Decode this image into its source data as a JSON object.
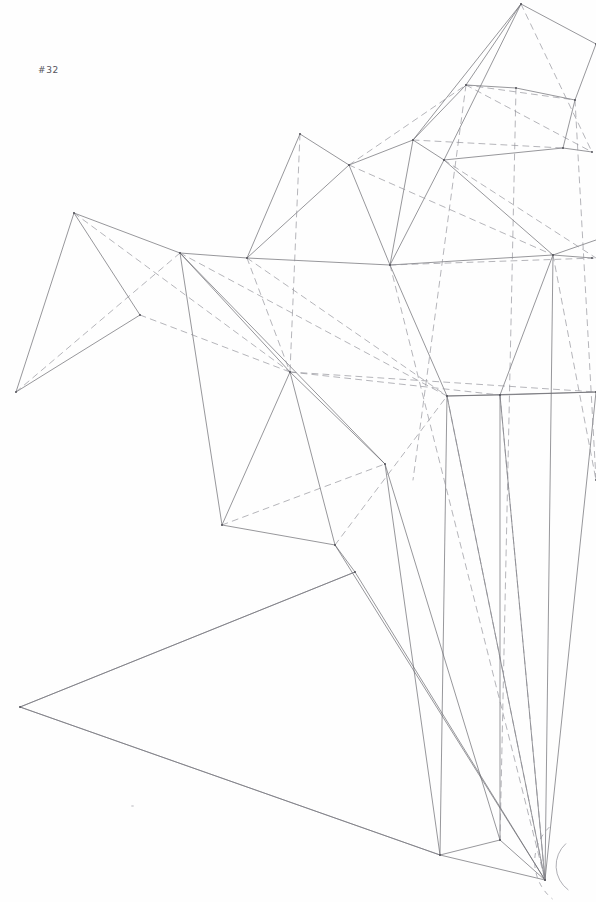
{
  "plate": {
    "label": "#32",
    "title": "Geometric wireframe plate #32",
    "background_color": "#fefefe",
    "ink_color": "#6a6a70",
    "ink_color_light": "#8d8d95",
    "ink_color_dark": "#4e4e56",
    "label_color": "#55555c",
    "width": 596,
    "height": 902,
    "line_styles": {
      "solid": "visible edge",
      "dashed": "hidden / construction edge"
    },
    "stroke_widths": {
      "thin": 0.55,
      "normal": 0.7,
      "heavy": 0.9
    },
    "dash_pattern": "6 5"
  },
  "geometry": {
    "description": "Polyhedral wireframe perspective study: faceted triangulated shell at upper right, folded zigzag wing at left, long converging edges descending to a lower-right hub, ground-plane outline at lower left, and a small arc detail at the right margin.",
    "vertices": [
      {
        "id": "apex-top",
        "x": 521,
        "y": 4
      },
      {
        "id": "upper-right-a",
        "x": 596,
        "y": 44
      },
      {
        "id": "node-hub-upper",
        "x": 466,
        "y": 85
      },
      {
        "id": "node-r-85",
        "x": 575,
        "y": 100
      },
      {
        "id": "node-ur-b",
        "x": 592,
        "y": 152
      },
      {
        "id": "node-mid-top",
        "x": 413,
        "y": 140
      },
      {
        "id": "node-300-135",
        "x": 300,
        "y": 134
      },
      {
        "id": "node-349-165",
        "x": 349,
        "y": 165
      },
      {
        "id": "node-444-160",
        "x": 444,
        "y": 160
      },
      {
        "id": "node-516-88",
        "x": 516,
        "y": 88
      },
      {
        "id": "node-563-148",
        "x": 563,
        "y": 148
      },
      {
        "id": "peak-left",
        "x": 74,
        "y": 213
      },
      {
        "id": "hub-left",
        "x": 180,
        "y": 253
      },
      {
        "id": "node-247-258",
        "x": 247,
        "y": 258
      },
      {
        "id": "node-390-265",
        "x": 390,
        "y": 265
      },
      {
        "id": "node-553-255",
        "x": 553,
        "y": 255
      },
      {
        "id": "node-592-258",
        "x": 592,
        "y": 258
      },
      {
        "id": "vertex-lower-left",
        "x": 16,
        "y": 392
      },
      {
        "id": "node-140-315",
        "x": 140,
        "y": 315
      },
      {
        "id": "hub-center",
        "x": 290,
        "y": 372
      },
      {
        "id": "node-447-396",
        "x": 447,
        "y": 396
      },
      {
        "id": "node-500-395",
        "x": 500,
        "y": 395
      },
      {
        "id": "node-596-392",
        "x": 596,
        "y": 392
      },
      {
        "id": "node-385-464",
        "x": 385,
        "y": 464
      },
      {
        "id": "node-222-525",
        "x": 222,
        "y": 525
      },
      {
        "id": "node-335-545",
        "x": 335,
        "y": 545
      },
      {
        "id": "node-355-572",
        "x": 355,
        "y": 572
      },
      {
        "id": "ground-left",
        "x": 20,
        "y": 707
      },
      {
        "id": "node-440-855",
        "x": 440,
        "y": 855
      },
      {
        "id": "node-500-840",
        "x": 500,
        "y": 840
      },
      {
        "id": "hub-bottom",
        "x": 545,
        "y": 880
      },
      {
        "id": "node-596-480",
        "x": 596,
        "y": 480
      }
    ],
    "solid_edges": [
      [
        521,
        4,
        466,
        85
      ],
      [
        521,
        4,
        413,
        140
      ],
      [
        521,
        4,
        444,
        160
      ],
      [
        521,
        4,
        596,
        44
      ],
      [
        596,
        44,
        575,
        100
      ],
      [
        575,
        100,
        563,
        148
      ],
      [
        563,
        148,
        592,
        152
      ],
      [
        466,
        85,
        413,
        140
      ],
      [
        466,
        85,
        516,
        88
      ],
      [
        516,
        88,
        575,
        100
      ],
      [
        413,
        140,
        349,
        165
      ],
      [
        413,
        140,
        444,
        160
      ],
      [
        413,
        140,
        390,
        265
      ],
      [
        444,
        160,
        563,
        148
      ],
      [
        444,
        160,
        553,
        255
      ],
      [
        444,
        160,
        390,
        265
      ],
      [
        349,
        165,
        300,
        134
      ],
      [
        300,
        134,
        247,
        258
      ],
      [
        349,
        165,
        247,
        258
      ],
      [
        349,
        165,
        390,
        265
      ],
      [
        390,
        265,
        553,
        255
      ],
      [
        390,
        265,
        247,
        258
      ],
      [
        553,
        255,
        592,
        258
      ],
      [
        553,
        255,
        596,
        240
      ],
      [
        553,
        255,
        500,
        395
      ],
      [
        247,
        258,
        180,
        253
      ],
      [
        180,
        253,
        74,
        213
      ],
      [
        74,
        213,
        16,
        392
      ],
      [
        74,
        213,
        140,
        315
      ],
      [
        140,
        315,
        16,
        392
      ],
      [
        180,
        253,
        290,
        372
      ],
      [
        180,
        253,
        222,
        525
      ],
      [
        180,
        253,
        385,
        464
      ],
      [
        290,
        372,
        385,
        464
      ],
      [
        290,
        372,
        222,
        525
      ],
      [
        290,
        372,
        335,
        545
      ],
      [
        222,
        525,
        335,
        545
      ],
      [
        335,
        545,
        355,
        572
      ],
      [
        355,
        572,
        20,
        707
      ],
      [
        20,
        707,
        440,
        855
      ],
      [
        385,
        464,
        440,
        855
      ],
      [
        385,
        464,
        500,
        840
      ],
      [
        440,
        855,
        500,
        840
      ],
      [
        440,
        855,
        545,
        880
      ],
      [
        500,
        840,
        545,
        880
      ],
      [
        447,
        396,
        440,
        855
      ],
      [
        500,
        395,
        500,
        840
      ],
      [
        500,
        395,
        545,
        880
      ],
      [
        447,
        396,
        545,
        880
      ],
      [
        553,
        255,
        545,
        880
      ],
      [
        596,
        392,
        545,
        880
      ],
      [
        390,
        265,
        447,
        396
      ],
      [
        447,
        396,
        500,
        395
      ],
      [
        447,
        396,
        596,
        392
      ],
      [
        500,
        395,
        596,
        392
      ],
      [
        335,
        545,
        545,
        880
      ],
      [
        355,
        572,
        545,
        880
      ]
    ],
    "dashed_edges": [
      [
        521,
        4,
        592,
        152
      ],
      [
        466,
        85,
        575,
        100
      ],
      [
        466,
        85,
        592,
        152
      ],
      [
        413,
        140,
        563,
        148
      ],
      [
        349,
        165,
        466,
        85
      ],
      [
        349,
        165,
        553,
        255
      ],
      [
        390,
        265,
        596,
        258
      ],
      [
        444,
        160,
        596,
        258
      ],
      [
        74,
        213,
        290,
        372
      ],
      [
        180,
        253,
        16,
        392
      ],
      [
        140,
        315,
        290,
        372
      ],
      [
        180,
        253,
        447,
        396
      ],
      [
        247,
        258,
        447,
        396
      ],
      [
        290,
        372,
        500,
        395
      ],
      [
        290,
        372,
        596,
        392
      ],
      [
        222,
        525,
        385,
        464
      ],
      [
        335,
        545,
        447,
        396
      ],
      [
        553,
        255,
        596,
        480
      ],
      [
        500,
        395,
        545,
        880
      ],
      [
        447,
        396,
        545,
        880
      ],
      [
        390,
        265,
        545,
        880
      ],
      [
        466,
        85,
        413,
        480
      ],
      [
        516,
        88,
        500,
        840
      ],
      [
        575,
        100,
        596,
        480
      ],
      [
        300,
        134,
        290,
        372
      ],
      [
        247,
        258,
        290,
        372
      ]
    ],
    "arc_detail": {
      "center_x": 596,
      "center_y": 866,
      "radius": 30,
      "note": "small circular arc at right margin near bottom hub"
    },
    "ground_plane": {
      "points": [
        [
          355,
          572
        ],
        [
          20,
          707
        ],
        [
          440,
          855
        ]
      ],
      "note": "open ground-plane outline, lower left"
    }
  }
}
